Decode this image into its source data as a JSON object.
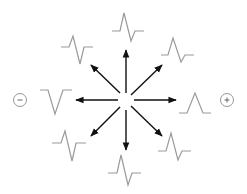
{
  "diagram": {
    "center": {
      "x": 126,
      "y": 100
    },
    "colors": {
      "arrow": "#111111",
      "waveform": "#9a9a9a",
      "pole": "#8a8a8a"
    },
    "poles": [
      {
        "name": "negative-pole",
        "sign": "−",
        "x": 20,
        "y": 100
      },
      {
        "name": "positive-pole",
        "sign": "+",
        "x": 227,
        "y": 100
      }
    ],
    "arrows": [
      {
        "direction": "up",
        "x2": 126,
        "y2": 50
      },
      {
        "direction": "up-right",
        "x2": 162,
        "y2": 65
      },
      {
        "direction": "right",
        "x2": 176,
        "y2": 100
      },
      {
        "direction": "down-right",
        "x2": 162,
        "y2": 136
      },
      {
        "direction": "down",
        "x2": 126,
        "y2": 150
      },
      {
        "direction": "down-left",
        "x2": 91,
        "y2": 136
      },
      {
        "direction": "left",
        "x2": 76,
        "y2": 100
      },
      {
        "direction": "up-left",
        "x2": 91,
        "y2": 65
      }
    ],
    "waveforms": [
      {
        "position": "top",
        "type": "biphasic"
      },
      {
        "position": "top-right",
        "type": "biphasic"
      },
      {
        "position": "right",
        "type": "positive-deflection"
      },
      {
        "position": "bottom-right",
        "type": "biphasic"
      },
      {
        "position": "bottom",
        "type": "biphasic"
      },
      {
        "position": "bottom-left",
        "type": "biphasic"
      },
      {
        "position": "left",
        "type": "negative-deflection"
      },
      {
        "position": "top-left",
        "type": "biphasic"
      }
    ]
  }
}
